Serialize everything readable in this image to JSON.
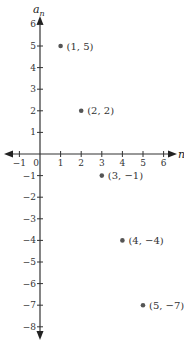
{
  "chart_data": {
    "type": "scatter",
    "title": "",
    "xlabel": "n",
    "ylabel": "a_n",
    "ylabel_main": "a",
    "ylabel_sub": "n",
    "xlim": [
      -1,
      6
    ],
    "ylim": [
      -8,
      6
    ],
    "xticks": [
      -1,
      0,
      1,
      2,
      3,
      4,
      5,
      6
    ],
    "yticks": [
      6,
      5,
      4,
      3,
      2,
      1,
      -1,
      -2,
      -3,
      -4,
      -5,
      -6,
      -7,
      -8
    ],
    "grid": false,
    "points": [
      {
        "x": 1,
        "y": 5,
        "label": "(1, 5)"
      },
      {
        "x": 2,
        "y": 2,
        "label": "(2, 2)"
      },
      {
        "x": 3,
        "y": -1,
        "label": "(3, −1)"
      },
      {
        "x": 4,
        "y": -4,
        "label": "(4, −4)"
      },
      {
        "x": 5,
        "y": -7,
        "label": "(5, −7)"
      }
    ]
  }
}
